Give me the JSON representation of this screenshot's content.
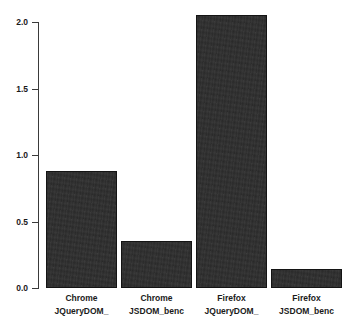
{
  "chart_data": {
    "type": "bar",
    "title": "in milliseconds",
    "xlabel": "",
    "ylabel": "",
    "ylim": [
      0.0,
      2.0
    ],
    "ytick_labels": [
      "0.0",
      "0.5",
      "1.0",
      "1.5",
      "2.0"
    ],
    "ytick_values": [
      0.0,
      0.5,
      1.0,
      1.5,
      2.0
    ],
    "grid": false,
    "legend": "none",
    "bar_color": "#2d2d2d",
    "bar_edge_color": "#141414",
    "categories": [
      "Chrome JQueryDOM_",
      "Chrome JSDOM_benc",
      "Firefox JQueryDOM_",
      "Firefox JSDOM_benc"
    ],
    "category_lines": [
      {
        "line1": "Chrome",
        "line2": "JQueryDOM_"
      },
      {
        "line1": "Chrome",
        "line2": "JSDOM_benc"
      },
      {
        "line1": "Firefox",
        "line2": "JQueryDOM_"
      },
      {
        "line1": "Firefox",
        "line2": "JSDOM_benc"
      }
    ],
    "values": [
      0.88,
      0.35,
      2.05,
      0.14
    ]
  }
}
